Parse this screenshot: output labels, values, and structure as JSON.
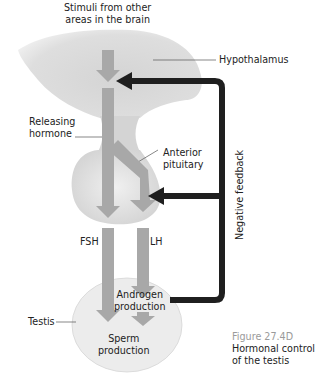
{
  "labels": {
    "stimuli": [
      "Stimuli from other",
      "areas in the brain"
    ],
    "hypothalamus": "Hypothalamus",
    "releasing_hormone": [
      "Releasing",
      "hormone"
    ],
    "anterior_pituitary": [
      "Anterior",
      "pituitary"
    ],
    "negative_feedback": "Negative feedback",
    "fsh": "FSH",
    "lh": "LH",
    "androgen": [
      "Androgen",
      "production"
    ],
    "testis": "Testis",
    "sperm": [
      "Sperm",
      "production"
    ]
  },
  "caption": {
    "number": "Figure 27.4D",
    "title_lines": [
      "Hormonal control",
      "of the testis"
    ]
  },
  "colors": {
    "hormone_arrow": "#a8a8a8",
    "feedback_arrow": "#1f1f1f",
    "organ_fill": "#dcdcdc",
    "testis_fill": "#ececec",
    "caption_number": "#9a9a9a"
  }
}
